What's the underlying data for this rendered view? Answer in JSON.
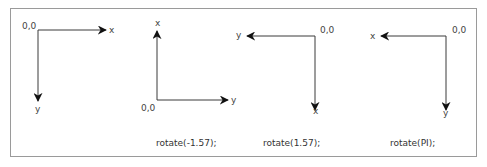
{
  "diagrams": [
    {
      "origin_label": "0,0",
      "horizontal_axis_label": "x",
      "vertical_axis_label": "y",
      "caption": ""
    },
    {
      "origin_label": "0,0",
      "horizontal_axis_label": "y",
      "vertical_axis_label": "x",
      "caption": "rotate(-1.57);"
    },
    {
      "origin_label": "0,0",
      "horizontal_axis_label": "y",
      "vertical_axis_label": "x",
      "caption": "rotate(1.57);"
    },
    {
      "origin_label": "0,0",
      "horizontal_axis_label": "x",
      "vertical_axis_label": "y",
      "caption": "rotate(PI);"
    }
  ],
  "colors": {
    "axis": "#3a3a3a",
    "arrowhead": "#111111",
    "frame": "#9a9a9a"
  }
}
